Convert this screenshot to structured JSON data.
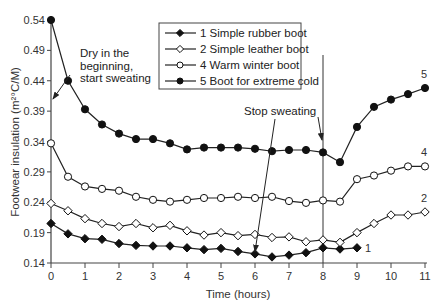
{
  "chart_data": {
    "type": "line",
    "title": "",
    "xlabel": "Time (hours)",
    "ylabel": "Footwear insulation (m²°C/M)",
    "xlim": [
      0,
      11
    ],
    "ylim": [
      0.14,
      0.54
    ],
    "xticks": [
      0,
      1,
      2,
      3,
      4,
      5,
      6,
      7,
      8,
      9,
      10,
      11
    ],
    "yticks": [
      0.14,
      0.19,
      0.24,
      0.29,
      0.34,
      0.39,
      0.44,
      0.49,
      0.54
    ],
    "ytick_labels": [
      "0.14",
      "0.19",
      "0.24",
      "0.29",
      "0.34",
      "0.39",
      "0.44",
      "0.49",
      "0.54"
    ],
    "grid": false,
    "legend_position": "top-center",
    "series": [
      {
        "name": "1 Simple rubber boot",
        "end_label": "1",
        "marker": "diamond-filled",
        "x": [
          0,
          0.5,
          1,
          1.5,
          2,
          2.5,
          3,
          3.5,
          4,
          4.5,
          5,
          5.5,
          6,
          6.5,
          7,
          7.5,
          8,
          8.5,
          9
        ],
        "values": [
          0.205,
          0.188,
          0.18,
          0.179,
          0.172,
          0.169,
          0.168,
          0.168,
          0.165,
          0.162,
          0.164,
          0.159,
          0.155,
          0.15,
          0.153,
          0.157,
          0.165,
          0.163,
          0.165
        ]
      },
      {
        "name": "2 Simple leather boot",
        "end_label": "2",
        "marker": "diamond-open",
        "x": [
          0,
          0.5,
          1,
          1.5,
          2,
          2.5,
          3,
          3.5,
          4,
          4.5,
          5,
          5.5,
          6,
          6.5,
          7,
          7.5,
          8,
          8.5,
          9,
          9.5,
          10,
          10.5,
          11
        ],
        "values": [
          0.238,
          0.226,
          0.213,
          0.205,
          0.2,
          0.205,
          0.198,
          0.202,
          0.193,
          0.186,
          0.19,
          0.185,
          0.187,
          0.182,
          0.183,
          0.175,
          0.178,
          0.174,
          0.19,
          0.205,
          0.219,
          0.219,
          0.224
        ]
      },
      {
        "name": "4 Warm winter boot",
        "end_label": "4",
        "marker": "circle-open",
        "x": [
          0,
          0.5,
          1,
          1.5,
          2,
          2.5,
          3,
          3.5,
          4,
          4.5,
          5,
          5.5,
          6,
          6.5,
          7,
          7.5,
          8,
          8.5,
          9,
          9.5,
          10,
          10.5,
          11
        ],
        "values": [
          0.337,
          0.282,
          0.266,
          0.262,
          0.259,
          0.249,
          0.244,
          0.241,
          0.244,
          0.247,
          0.247,
          0.249,
          0.247,
          0.249,
          0.242,
          0.239,
          0.243,
          0.241,
          0.278,
          0.284,
          0.292,
          0.299,
          0.299
        ]
      },
      {
        "name": "5 Boot for extreme cold",
        "end_label": "5",
        "marker": "circle-filled",
        "x": [
          0,
          0.5,
          1,
          1.5,
          2,
          2.5,
          3,
          3.5,
          4,
          4.5,
          5,
          5.5,
          6,
          6.5,
          7,
          7.5,
          8,
          8.5,
          9,
          9.5,
          10,
          10.5,
          11
        ],
        "values": [
          0.54,
          0.44,
          0.393,
          0.368,
          0.353,
          0.344,
          0.344,
          0.337,
          0.327,
          0.33,
          0.33,
          0.33,
          0.328,
          0.324,
          0.326,
          0.326,
          0.322,
          0.306,
          0.364,
          0.397,
          0.409,
          0.418,
          0.428
        ]
      }
    ],
    "annotations": [
      {
        "text_lines": [
          "Dry in the",
          "beginning,",
          "start sweating"
        ],
        "arrow_to": [
          0,
          0.41
        ]
      },
      {
        "text_lines": [
          "Stop sweating"
        ],
        "arrow_targets": [
          [
            6,
            0.152
          ],
          [
            8,
            0.326
          ]
        ]
      }
    ],
    "vertical_line_x": 8
  }
}
